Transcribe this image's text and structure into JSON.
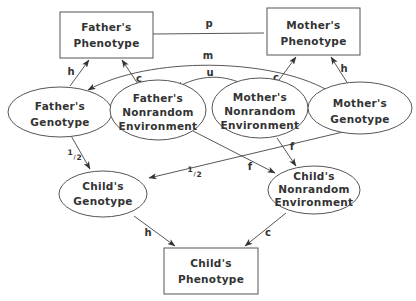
{
  "diagram": {
    "type": "path-diagram",
    "nodes": {
      "father_phenotype": {
        "line1": "Father's",
        "line2": "Phenotype",
        "shape": "box"
      },
      "mother_phenotype": {
        "line1": "Mother's",
        "line2": "Phenotype",
        "shape": "box"
      },
      "father_genotype": {
        "line1": "Father's",
        "line2": "Genotype",
        "shape": "ellipse"
      },
      "father_env": {
        "line1": "Father's",
        "line2": "Nonrandom",
        "line3": "Environment",
        "shape": "ellipse"
      },
      "mother_env": {
        "line1": "Mother's",
        "line2": "Nonrandom",
        "line3": "Environment",
        "shape": "ellipse"
      },
      "mother_genotype": {
        "line1": "Mother's",
        "line2": "Genotype",
        "shape": "ellipse"
      },
      "child_genotype": {
        "line1": "Child's",
        "line2": "Genotype",
        "shape": "ellipse"
      },
      "child_env": {
        "line1": "Child's",
        "line2": "Nonrandom",
        "line3": "Environment",
        "shape": "ellipse"
      },
      "child_phenotype": {
        "line1": "Child's",
        "line2": "Phenotype",
        "shape": "box"
      }
    },
    "edges": [
      {
        "from": "father_phenotype",
        "to": "mother_phenotype",
        "label": "p",
        "kind": "line"
      },
      {
        "from": "mother_genotype",
        "to": "father_genotype",
        "label": "m",
        "kind": "curved-arrow"
      },
      {
        "from": "father_env",
        "to": "mother_env",
        "label": "u",
        "kind": "double-arrow"
      },
      {
        "from": "father_genotype",
        "to": "father_phenotype",
        "label": "h",
        "kind": "arrow"
      },
      {
        "from": "father_env",
        "to": "father_phenotype",
        "label": "c",
        "kind": "arrow"
      },
      {
        "from": "mother_env",
        "to": "mother_phenotype",
        "label": "c",
        "kind": "arrow"
      },
      {
        "from": "mother_genotype",
        "to": "mother_phenotype",
        "label": "h",
        "kind": "arrow"
      },
      {
        "from": "father_genotype",
        "to": "child_genotype",
        "label": "1/2",
        "kind": "arrow"
      },
      {
        "from": "mother_genotype",
        "to": "child_genotype",
        "label": "1/2",
        "kind": "arrow"
      },
      {
        "from": "father_env",
        "to": "child_env",
        "label": "f",
        "kind": "arrow"
      },
      {
        "from": "mother_env",
        "to": "child_env",
        "label": "f",
        "kind": "arrow"
      },
      {
        "from": "child_genotype",
        "to": "child_phenotype",
        "label": "h",
        "kind": "arrow"
      },
      {
        "from": "child_env",
        "to": "child_phenotype",
        "label": "c",
        "kind": "arrow"
      }
    ],
    "labels": {
      "p": "p",
      "m": "m",
      "u": "u",
      "h": "h",
      "c": "c",
      "f": "f",
      "half_num": "1",
      "half_den": "2"
    }
  }
}
